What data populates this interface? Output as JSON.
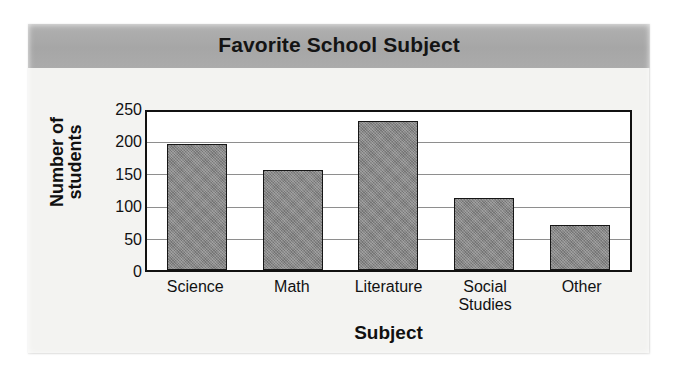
{
  "card": {
    "background_color": "#f3f3f1"
  },
  "banner": {
    "background_color": "#a9a9a9",
    "title": "Favorite School Subject"
  },
  "chart_data": {
    "type": "bar",
    "title": "Favorite School Subject",
    "xlabel": "Subject",
    "ylabel": "Number of students",
    "ylabel_lines": [
      "Number of",
      "students"
    ],
    "categories": [
      "Science",
      "Math",
      "Literature",
      "Social Studies",
      "Other"
    ],
    "category_label_lines": [
      [
        "Science"
      ],
      [
        "Math"
      ],
      [
        "Literature"
      ],
      [
        "Social",
        "Studies"
      ],
      [
        "Other"
      ]
    ],
    "values": [
      200,
      160,
      238,
      114,
      72
    ],
    "ylim": [
      0,
      250
    ],
    "ytick_values": [
      0,
      50,
      100,
      150,
      200,
      250
    ],
    "ytick_labels": [
      "0",
      "50",
      "100",
      "150",
      "200",
      "250"
    ],
    "grid": true,
    "grid_axis": "y",
    "legend": false,
    "bar_color": "#808080",
    "bar_edge_color": "#161616",
    "plot_background": "#ffffff",
    "axis_color": "#111111",
    "gridline_color": "#8e8e8e"
  }
}
